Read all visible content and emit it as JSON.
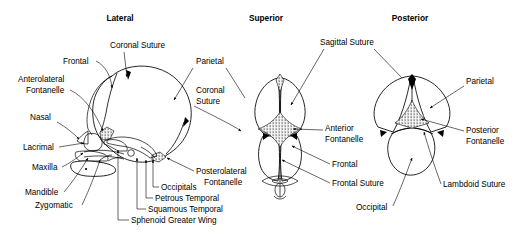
{
  "figure": {
    "kind": "anatomical-diagram",
    "panel_count": 3
  },
  "panels": [
    {
      "id": "lateral",
      "title": "Lateral"
    },
    {
      "id": "superior",
      "title": "Superior"
    },
    {
      "id": "posterior",
      "title": "Posterior"
    }
  ],
  "labels": {
    "lateral": [
      {
        "key": "coronal_suture",
        "text": "Coronal Suture"
      },
      {
        "key": "frontal",
        "text": "Frontal"
      },
      {
        "key": "anterolateral_1",
        "text": "Anterolateral"
      },
      {
        "key": "anterolateral_2",
        "text": "Fontanelle"
      },
      {
        "key": "nasal",
        "text": "Nasal"
      },
      {
        "key": "lacrimal",
        "text": "Lacrimal"
      },
      {
        "key": "maxilla",
        "text": "Maxilla"
      },
      {
        "key": "mandible",
        "text": "Mandible"
      },
      {
        "key": "zygomatic",
        "text": "Zygomatic"
      },
      {
        "key": "parietal",
        "text": "Parietal"
      },
      {
        "key": "coronal_suture_2a",
        "text": "Coronal"
      },
      {
        "key": "coronal_suture_2b",
        "text": "Suture"
      },
      {
        "key": "posterolateral_1",
        "text": "Posterolateral"
      },
      {
        "key": "posterolateral_2",
        "text": "Fontanelle"
      },
      {
        "key": "occipitals",
        "text": "Occipitals"
      },
      {
        "key": "petrous_temporal",
        "text": "Petrous Temporal"
      },
      {
        "key": "squamous_temporal",
        "text": "Squamous Temporal"
      },
      {
        "key": "sphenoid_greater_wing",
        "text": "Sphenoid Greater Wing"
      }
    ],
    "superior": [
      {
        "key": "sagittal_suture",
        "text": "Sagittal Suture"
      },
      {
        "key": "anterior_font_1",
        "text": "Anterior"
      },
      {
        "key": "anterior_font_2",
        "text": "Fontanelle"
      },
      {
        "key": "frontal",
        "text": "Frontal"
      },
      {
        "key": "frontal_suture",
        "text": "Frontal  Suture"
      }
    ],
    "posterior": [
      {
        "key": "parietal",
        "text": "Parietal"
      },
      {
        "key": "posterior_font_1",
        "text": "Posterior"
      },
      {
        "key": "posterior_font_2",
        "text": "Fontanelle"
      },
      {
        "key": "lambdoid_suture",
        "text": "Lambdoid Suture"
      },
      {
        "key": "occipital",
        "text": "Occipital"
      }
    ]
  },
  "colors": {
    "ink": "#000000",
    "paper": "#ffffff"
  }
}
